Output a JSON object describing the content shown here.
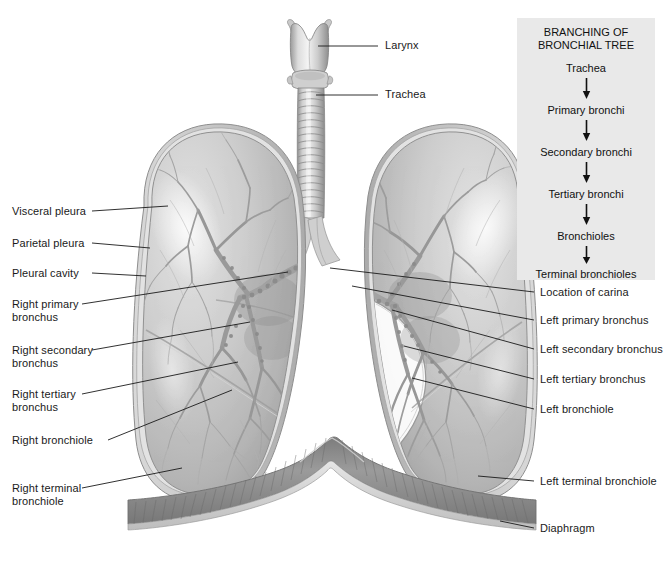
{
  "figure": {
    "background": "#ffffff",
    "line_color": "#1a1a1a",
    "text_color": "#1a1a1a"
  },
  "flowchart": {
    "title": "BRANCHING OF\nBRONCHIAL TREE",
    "background": "#e9e9e9",
    "steps": [
      "Trachea",
      "Primary bronchi",
      "Secondary bronchi",
      "Tertiary bronchi",
      "Bronchioles",
      "Terminal bronchioles"
    ]
  },
  "labels_top": [
    {
      "text": "Larynx",
      "x": 385,
      "y": 45
    },
    {
      "text": "Trachea",
      "x": 385,
      "y": 94
    }
  ],
  "labels_left": [
    {
      "text": "Visceral pleura",
      "x": 12,
      "y": 207
    },
    {
      "text": "Parietal pleura",
      "x": 12,
      "y": 239
    },
    {
      "text": "Pleural cavity",
      "x": 12,
      "y": 269
    },
    {
      "text": "Right primary\nbronchus",
      "x": 12,
      "y": 300
    },
    {
      "text": "Right secondary\nbronchus",
      "x": 12,
      "y": 346
    },
    {
      "text": "Right tertiary\nbronchus",
      "x": 12,
      "y": 390
    },
    {
      "text": "Right bronchiole",
      "x": 12,
      "y": 436
    },
    {
      "text": "Right terminal\nbronchiole",
      "x": 12,
      "y": 484
    }
  ],
  "labels_right": [
    {
      "text": "Left primary bronchus",
      "x": 540,
      "y": 316
    },
    {
      "text": "Location of carina",
      "x": 540,
      "y": 288
    },
    {
      "text": "Left secondary bronchus",
      "x": 540,
      "y": 345
    },
    {
      "text": "Left tertiary bronchus",
      "x": 540,
      "y": 375
    },
    {
      "text": "Left bronchiole",
      "x": 540,
      "y": 405
    },
    {
      "text": "Left terminal bronchiole",
      "x": 540,
      "y": 477
    },
    {
      "text": "Diaphragm",
      "x": 540,
      "y": 524
    }
  ]
}
